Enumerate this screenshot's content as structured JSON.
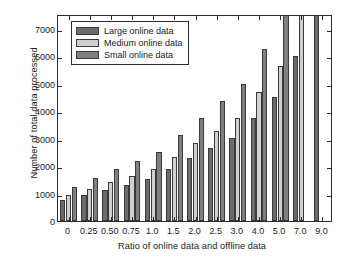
{
  "chart_data": {
    "type": "bar",
    "title": "",
    "xlabel": "Ratio of online data and offline data",
    "ylabel": "Number of total data processed",
    "categories": [
      "0",
      "0.25",
      "0.50",
      "0.75",
      "1.0",
      "1.5",
      "2.0",
      "2.5",
      "3.0",
      "4.0",
      "5.0",
      "7.0",
      "9.0"
    ],
    "series": [
      {
        "name": "Large online data",
        "color": "#6b6b6b",
        "values": [
          750,
          950,
          1130,
          1330,
          1520,
          1890,
          2290,
          2650,
          3020,
          3770,
          4520,
          6020,
          7550
        ]
      },
      {
        "name": "Medium online data",
        "color": "#d0d0d0",
        "values": [
          960,
          1180,
          1420,
          1650,
          1900,
          2340,
          2830,
          3290,
          3770,
          4690,
          5660,
          7550,
          null
        ]
      },
      {
        "name": "Small online data",
        "color": "#808080",
        "values": [
          1250,
          1580,
          1890,
          2200,
          2510,
          3140,
          3770,
          4390,
          5010,
          6280,
          7550,
          null,
          null
        ]
      }
    ],
    "ylim": [
      0,
      7550
    ],
    "yticks": [
      0,
      1000,
      2000,
      3000,
      4000,
      5000,
      6000,
      7000
    ],
    "ytick_labels": [
      "0",
      "1000",
      "2000",
      "3000",
      "4000",
      "5000",
      "6000",
      "7000"
    ],
    "grid": false,
    "legend_position": "upper left",
    "clipped_note": "Bars at the top of the axis are cut off by the frame"
  },
  "legend": {
    "entries": [
      {
        "label": "Large online data"
      },
      {
        "label": "Medium online data"
      },
      {
        "label": "Small online data"
      }
    ]
  }
}
